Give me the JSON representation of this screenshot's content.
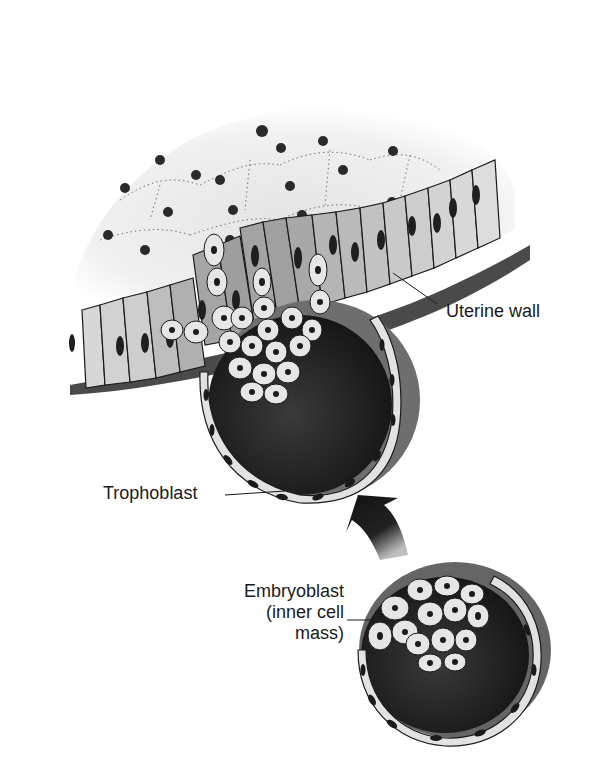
{
  "figure": {
    "style": "grayscale line illustration",
    "colors": {
      "background": "#ffffff",
      "ink": "#1a1a1a",
      "epithelium_light": "#d9d9d9",
      "epithelium_mid": "#a8a8a8",
      "stroma": "#ececec",
      "cavity_dark": "#2b2b2b",
      "outer_shell": "#6e6e6e",
      "cell_light": "#e6e6e6",
      "nucleus": "#1a1a1a"
    }
  },
  "labels": {
    "uterine_wall": "Uterine wall",
    "trophoblast": "Trophoblast",
    "embryoblast_line1": "Embryoblast",
    "embryoblast_line2": "(inner cell",
    "embryoblast_line3": "mass)"
  },
  "elements": {
    "implanting_blastocyst": "Blastocyst embedded in uterine wall",
    "free_blastocyst": "Blastocyst before implantation",
    "arrow": "Curved arrow pointing from free blastocyst to implanted blastocyst"
  }
}
